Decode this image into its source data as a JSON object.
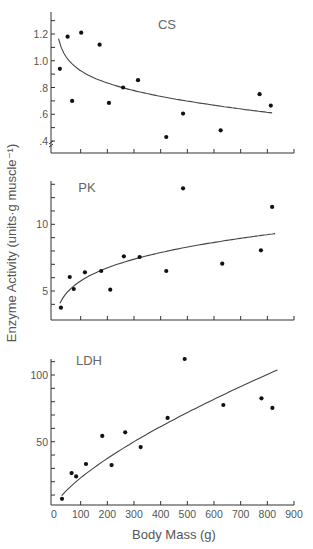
{
  "chart_data": [
    {
      "type": "scatter",
      "panel_label": "CS",
      "xlabel": "Body Mass (g)",
      "ylabel": "Enzyme Activity (units·g muscle⁻¹)",
      "xlim": [
        0,
        900
      ],
      "ylim": [
        0.35,
        1.35
      ],
      "y_ticks": [
        0.4,
        0.6,
        0.8,
        1.0,
        1.2
      ],
      "y_tick_labels": [
        ".4",
        ".6",
        ".8",
        "1.0",
        "1.2"
      ],
      "y_minor_step": 0.1,
      "axis_break": true,
      "series": [
        {
          "name": "observed",
          "x": [
            22,
            51,
            68,
            102,
            171,
            206,
            259,
            315,
            421,
            484,
            625,
            771,
            813
          ],
          "y": [
            0.94,
            1.18,
            0.7,
            1.21,
            1.12,
            0.685,
            0.8,
            0.855,
            0.43,
            0.605,
            0.48,
            0.75,
            0.665
          ]
        },
        {
          "name": "fit",
          "kind": "power-curve",
          "x_range": [
            17,
            818
          ],
          "y_at_ends": [
            1.165,
            0.61
          ],
          "exponent": -0.12
        }
      ],
      "grid": false
    },
    {
      "type": "scatter",
      "panel_label": "PK",
      "xlim": [
        0,
        900
      ],
      "ylim": [
        3,
        13.2
      ],
      "y_ticks": [
        5,
        10
      ],
      "y_tick_labels": [
        "5",
        "10"
      ],
      "y_minor_step": 1,
      "series": [
        {
          "name": "observed",
          "x": [
            26,
            59,
            74,
            116,
            177,
            211,
            262,
            321,
            421,
            484,
            631,
            776,
            818
          ],
          "y": [
            3.75,
            6.05,
            5.15,
            6.4,
            6.5,
            5.1,
            7.6,
            7.55,
            6.5,
            12.7,
            7.05,
            8.05,
            11.3
          ]
        },
        {
          "name": "fit",
          "kind": "power-curve",
          "x_range": [
            22,
            829
          ],
          "y_at_ends": [
            4.08,
            9.3
          ],
          "exponent": 0.227
        }
      ],
      "grid": false
    },
    {
      "type": "scatter",
      "panel_label": "LDH",
      "xlim": [
        0,
        900
      ],
      "ylim": [
        2.5,
        111
      ],
      "y_ticks": [
        50,
        100
      ],
      "y_tick_labels": [
        "50",
        "100"
      ],
      "y_minor_step": 10,
      "x_ticks": [
        0,
        100,
        200,
        300,
        400,
        500,
        600,
        700,
        800,
        900
      ],
      "x_tick_labels": [
        "0",
        "100",
        "200",
        "300",
        "400",
        "500",
        "600",
        "700",
        "800",
        "900"
      ],
      "series": [
        {
          "name": "observed",
          "x": [
            30,
            66,
            83,
            120,
            181,
            216,
            267,
            325,
            426,
            490,
            635,
            778,
            819
          ],
          "y": [
            7.2,
            26.5,
            24,
            33.3,
            54.3,
            32.5,
            57,
            46,
            67.8,
            112,
            77.5,
            82.5,
            75.3
          ]
        },
        {
          "name": "fit",
          "kind": "power-curve",
          "x_range": [
            29,
            838
          ],
          "y_at_ends": [
            9.5,
            103.8
          ],
          "exponent": 0.71
        }
      ],
      "grid": false
    }
  ],
  "figure": {
    "shared_xlabel": "Body Mass (g)",
    "shared_ylabel": "Enzyme Activity (units·g muscle⁻¹)",
    "point_color": "#111111",
    "line_color": "#444444",
    "axis_color": "#333333"
  }
}
